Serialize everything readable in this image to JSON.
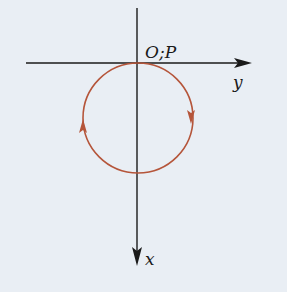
{
  "diagram": {
    "background": "#e9eef4",
    "axis_color": "#1a1a1a",
    "circle_color": "#b5553a",
    "labels": {
      "origin": "O;P",
      "horizontal_axis": "y",
      "vertical_axis": "x"
    },
    "circle": {
      "description": "circle tangent to y-axis at origin O, lying along positive x direction (downward)",
      "direction": "clockwise as drawn (down on right side, up on left side)"
    }
  }
}
